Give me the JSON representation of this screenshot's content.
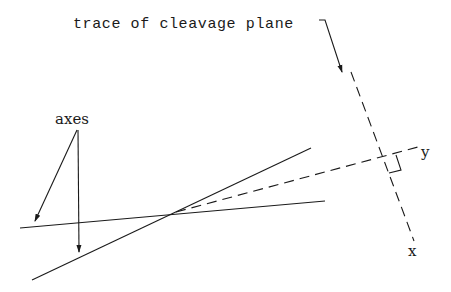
{
  "diagram": {
    "type": "geometric-construction",
    "labels": {
      "trace": "trace of cleavage plane",
      "axes": "axes",
      "x": "x",
      "y": "y"
    },
    "elements": [
      {
        "id": "solid-line-1",
        "style": "solid",
        "from": [
          20,
          228
        ],
        "to": [
          325,
          201
        ]
      },
      {
        "id": "solid-line-2",
        "style": "solid",
        "from": [
          32,
          280
        ],
        "to": [
          311,
          148
        ]
      },
      {
        "id": "dashed-y-line",
        "style": "dashed",
        "from": [
          176,
          212
        ],
        "to": [
          418,
          147
        ]
      },
      {
        "id": "dashed-trace-x-line",
        "style": "dashed",
        "from": [
          351,
          72
        ],
        "to": [
          414,
          241
        ]
      },
      {
        "id": "right-angle-marker",
        "style": "solid"
      },
      {
        "id": "axes-arrow-left",
        "from": [
          77,
          130
        ],
        "to": [
          35,
          222
        ]
      },
      {
        "id": "axes-arrow-down",
        "from": [
          78,
          130
        ],
        "to": [
          79,
          252
        ]
      },
      {
        "id": "trace-arrow",
        "from": [
          318,
          20
        ],
        "to": [
          342,
          73
        ]
      }
    ],
    "colors": {
      "stroke": "#1a1a1a",
      "background": "#ffffff"
    }
  }
}
